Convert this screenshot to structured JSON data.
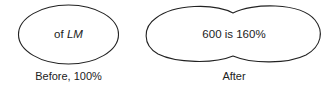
{
  "before": {
    "inner_text_prefix": "of ",
    "inner_text_italic": "LM",
    "caption": "Before, 100%"
  },
  "after": {
    "inner_text": "600 is 160%",
    "caption": "After"
  },
  "colors": {
    "stroke": "#222222",
    "background": "#ffffff"
  }
}
